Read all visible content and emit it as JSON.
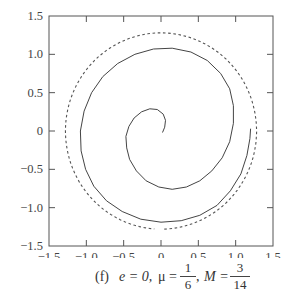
{
  "chart_data": {
    "type": "line",
    "title": "",
    "caption": {
      "label": "(f)",
      "e_text": "e = 0,",
      "mu_symbol": "μ =",
      "mu_num": "1",
      "mu_den": "6",
      "m_symbol": "M =",
      "m_num": "3",
      "m_den": "14"
    },
    "xlabel": "",
    "ylabel": "",
    "xlim": [
      -1.5,
      1.5
    ],
    "ylim": [
      -1.5,
      1.5
    ],
    "xticks": [
      -1.5,
      -1.0,
      -0.5,
      0,
      0.5,
      1.0,
      1.5
    ],
    "yticks": [
      -1.5,
      -1.0,
      -0.5,
      0,
      0.5,
      1.0,
      1.5
    ],
    "xtick_labels": [
      "−1.5",
      "−1.0",
      "−0.5",
      "0",
      "0.5",
      "1.0",
      "1.5"
    ],
    "ytick_labels": [
      "−1.5",
      "−1.0",
      "−0.5",
      "0",
      "0.5",
      "1.0",
      "1.5"
    ],
    "grid": false,
    "legend": null,
    "series": [
      {
        "name": "spiral trajectory",
        "style": "solid",
        "points": [
          [
            0.02,
            -0.02
          ],
          [
            0.05,
            0.05
          ],
          [
            0.06,
            0.14
          ],
          [
            0.03,
            0.22
          ],
          [
            -0.05,
            0.28
          ],
          [
            -0.15,
            0.29
          ],
          [
            -0.26,
            0.25
          ],
          [
            -0.36,
            0.17
          ],
          [
            -0.43,
            0.06
          ],
          [
            -0.47,
            -0.07
          ],
          [
            -0.46,
            -0.22
          ],
          [
            -0.42,
            -0.37
          ],
          [
            -0.33,
            -0.52
          ],
          [
            -0.2,
            -0.65
          ],
          [
            -0.03,
            -0.73
          ],
          [
            0.15,
            -0.76
          ],
          [
            0.34,
            -0.73
          ],
          [
            0.52,
            -0.65
          ],
          [
            0.68,
            -0.52
          ],
          [
            0.82,
            -0.35
          ],
          [
            0.92,
            -0.14
          ],
          [
            0.97,
            0.1
          ],
          [
            0.97,
            0.33
          ],
          [
            0.92,
            0.55
          ],
          [
            0.8,
            0.75
          ],
          [
            0.62,
            0.92
          ],
          [
            0.4,
            1.03
          ],
          [
            0.15,
            1.08
          ],
          [
            -0.1,
            1.07
          ],
          [
            -0.35,
            1.0
          ],
          [
            -0.58,
            0.88
          ],
          [
            -0.78,
            0.71
          ],
          [
            -0.93,
            0.5
          ],
          [
            -1.03,
            0.26
          ],
          [
            -1.08,
            0.0
          ],
          [
            -1.07,
            -0.26
          ],
          [
            -1.01,
            -0.5
          ],
          [
            -0.9,
            -0.72
          ],
          [
            -0.73,
            -0.91
          ],
          [
            -0.52,
            -1.05
          ],
          [
            -0.27,
            -1.15
          ],
          [
            0.0,
            -1.19
          ],
          [
            0.27,
            -1.17
          ],
          [
            0.52,
            -1.1
          ],
          [
            0.75,
            -0.97
          ],
          [
            0.93,
            -0.78
          ],
          [
            1.07,
            -0.56
          ],
          [
            1.15,
            -0.32
          ],
          [
            1.19,
            -0.1
          ],
          [
            1.2,
            0.03
          ]
        ]
      },
      {
        "name": "boundary circle",
        "style": "dashed",
        "center": [
          0,
          0
        ],
        "radius": 1.28,
        "arc_degrees": [
          -88,
          268
        ]
      }
    ]
  }
}
